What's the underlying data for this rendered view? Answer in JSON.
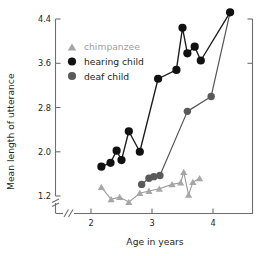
{
  "chart_data": {
    "type": "line",
    "title": "",
    "xlabel": "Age in years",
    "ylabel": "Mean length of utterance",
    "xlim": [
      2.05,
      4.45
    ],
    "ylim": [
      1.0,
      4.62
    ],
    "xticks": [
      2,
      3,
      4
    ],
    "xticklabels": [
      "2",
      "3",
      "4"
    ],
    "yticks": [
      1.2,
      2.0,
      2.8,
      3.6,
      4.4
    ],
    "yticklabels": [
      "1.2",
      "2.0",
      "2.8",
      "3.6",
      "4.4"
    ],
    "grid": false,
    "axis_break_x": true,
    "axis_break_y": true,
    "legend_position": "upper-left-inside",
    "series": [
      {
        "name": "chimpanzee",
        "marker": "triangle",
        "color": "#a6a6a6",
        "x": [
          2.17,
          2.33,
          2.47,
          2.62,
          2.8,
          2.95,
          3.12,
          3.33,
          3.47,
          3.52,
          3.6,
          3.67,
          3.78
        ],
        "y": [
          1.36,
          1.14,
          1.18,
          1.09,
          1.25,
          1.29,
          1.33,
          1.41,
          1.44,
          1.63,
          1.22,
          1.45,
          1.52
        ]
      },
      {
        "name": "hearing child",
        "marker": "circle",
        "color": "#111111",
        "x": [
          2.17,
          2.32,
          2.42,
          2.5,
          2.62,
          2.8,
          3.1,
          3.4,
          3.5,
          3.58,
          3.7,
          3.8,
          4.28
        ],
        "y": [
          1.73,
          1.8,
          2.02,
          1.85,
          2.37,
          2.0,
          3.32,
          3.48,
          4.24,
          3.78,
          3.9,
          3.65,
          4.52
        ]
      },
      {
        "name": "deaf child",
        "marker": "circle",
        "color": "#5a5a5a",
        "x": [
          2.83,
          2.95,
          3.03,
          3.13,
          3.58,
          3.97,
          4.28
        ],
        "y": [
          1.41,
          1.52,
          1.55,
          1.57,
          2.73,
          3.0,
          4.52
        ]
      }
    ]
  },
  "legend": {
    "items": [
      {
        "label": "chimpanzee",
        "marker": "triangle",
        "color": "#a6a6a6",
        "text_color": "#a0a0a0"
      },
      {
        "label": "hearing child",
        "marker": "circle",
        "color": "#111111",
        "text_color": "#231f20"
      },
      {
        "label": "deaf child",
        "marker": "circle",
        "color": "#5a5a5a",
        "text_color": "#231f20"
      }
    ]
  }
}
